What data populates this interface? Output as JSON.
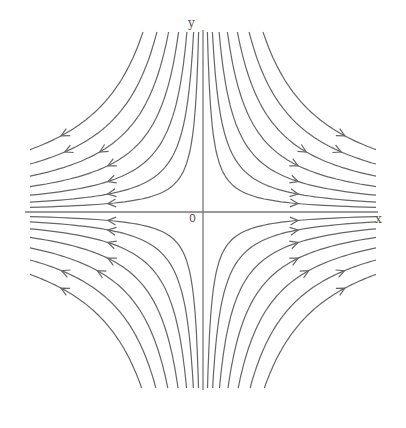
{
  "diagram": {
    "type": "phase-portrait-saddle",
    "labels": {
      "x_axis": "x",
      "y_axis": "y",
      "origin": "0"
    },
    "origin_px": [
      203,
      212
    ],
    "x_axis_px": [
      25,
      378
    ],
    "y_axis_px": [
      30,
      390
    ],
    "curve_constants": [
      800,
      1700,
      2900,
      4400,
      6200,
      8300,
      10800
    ],
    "line_color": "#666666",
    "axis_color": "#777777",
    "quadrants": [
      {
        "name": "upper-right",
        "direction": "outward-right"
      },
      {
        "name": "upper-left",
        "direction": "outward-left"
      },
      {
        "name": "lower-left",
        "direction": "outward-left"
      },
      {
        "name": "lower-right",
        "direction": "outward-right"
      }
    ]
  }
}
